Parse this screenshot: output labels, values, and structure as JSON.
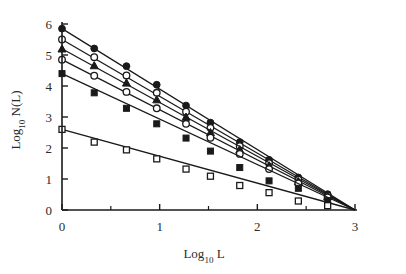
{
  "chart_data": {
    "type": "line",
    "title": "",
    "subtitle": "",
    "xlabel": "Log10 L",
    "xlabel_base": "Log",
    "xlabel_sub": "10",
    "xlabel_tail": "L",
    "ylabel": "Log10 N(L)",
    "ylabel_base": "Log",
    "ylabel_sub": "10",
    "ylabel_tail": "N(L)",
    "xlim": [
      0,
      3
    ],
    "ylim": [
      0,
      6
    ],
    "xticks": [
      0,
      1,
      2,
      3
    ],
    "xtick_labels": [
      "0",
      "1",
      "2",
      "3"
    ],
    "x_minor_ticks": [
      0.5,
      1.5,
      2.5
    ],
    "yticks": [
      0,
      1,
      2,
      3,
      4,
      5,
      6
    ],
    "ytick_labels": [
      "0",
      "1",
      "2",
      "3",
      "4",
      "5",
      "6"
    ],
    "grid": false,
    "legend": "none",
    "convergence_point": [
      3,
      0
    ],
    "x": [
      0,
      0.33,
      0.66,
      0.97,
      1.27,
      1.52,
      1.82,
      2.12,
      2.42,
      2.72
    ],
    "series": [
      {
        "name": "series-1",
        "marker": "filled-circle",
        "intercept": 5.85,
        "slope": -1.95,
        "values": [
          5.85,
          5.21,
          4.64,
          4.04,
          3.37,
          2.82,
          2.19,
          1.62,
          1.05,
          0.51
        ]
      },
      {
        "name": "series-2",
        "marker": "open-circle",
        "intercept": 5.5,
        "slope": -1.833,
        "values": [
          5.5,
          4.93,
          4.34,
          3.78,
          3.17,
          2.65,
          2.06,
          1.51,
          0.98,
          0.47
        ]
      },
      {
        "name": "series-3",
        "marker": "filled-triangle",
        "intercept": 5.2,
        "slope": -1.733,
        "values": [
          5.2,
          4.66,
          4.1,
          3.56,
          3.0,
          2.5,
          1.95,
          1.43,
          0.92,
          0.44
        ]
      },
      {
        "name": "series-4",
        "marker": "open-circle",
        "intercept": 4.85,
        "slope": -1.617,
        "values": [
          4.85,
          4.33,
          3.81,
          3.28,
          2.78,
          2.33,
          1.81,
          1.32,
          0.86,
          0.41
        ]
      },
      {
        "name": "series-5",
        "marker": "filled-square",
        "intercept": 4.4,
        "slope": -1.467,
        "values": [
          4.4,
          3.78,
          3.28,
          2.78,
          2.32,
          1.9,
          1.37,
          0.94,
          0.7,
          0.3
        ]
      },
      {
        "name": "series-6",
        "marker": "open-square",
        "intercept": 2.6,
        "slope": -0.867,
        "values": [
          2.6,
          2.19,
          1.94,
          1.65,
          1.32,
          1.09,
          0.79,
          0.56,
          0.29,
          0.14
        ]
      }
    ]
  }
}
